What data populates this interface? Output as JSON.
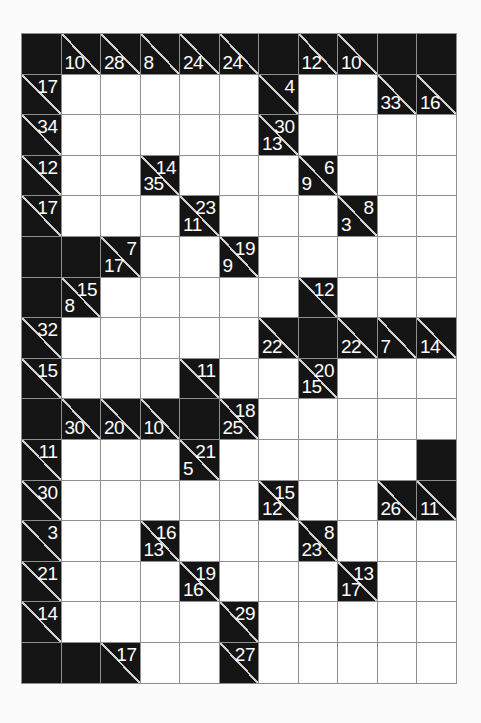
{
  "puzzle": {
    "type": "kakuro",
    "rows": 16,
    "cols": 11,
    "colors": {
      "page_bg": "#fbfbfb",
      "block": "#141414",
      "cell_bg": "#fefefe",
      "grid_line": "#8f8f8f",
      "diagonal": "#cfcfcf",
      "clue_text": "#ffffff"
    },
    "grid": [
      [
        {
          "t": "B"
        },
        {
          "t": "C",
          "d": 10
        },
        {
          "t": "C",
          "d": 28
        },
        {
          "t": "C",
          "d": 8
        },
        {
          "t": "C",
          "d": 24
        },
        {
          "t": "C",
          "d": 24
        },
        {
          "t": "B"
        },
        {
          "t": "C",
          "d": 12
        },
        {
          "t": "C",
          "d": 10
        },
        {
          "t": "B"
        },
        {
          "t": "B"
        }
      ],
      [
        {
          "t": "C",
          "a": 17
        },
        {
          "t": "W"
        },
        {
          "t": "W"
        },
        {
          "t": "W"
        },
        {
          "t": "W"
        },
        {
          "t": "W"
        },
        {
          "t": "C",
          "a": 4
        },
        {
          "t": "W"
        },
        {
          "t": "W"
        },
        {
          "t": "C",
          "d": 33
        },
        {
          "t": "C",
          "d": 16
        }
      ],
      [
        {
          "t": "C",
          "a": 34
        },
        {
          "t": "W"
        },
        {
          "t": "W"
        },
        {
          "t": "W"
        },
        {
          "t": "W"
        },
        {
          "t": "W"
        },
        {
          "t": "C",
          "a": 30,
          "d": 13
        },
        {
          "t": "W"
        },
        {
          "t": "W"
        },
        {
          "t": "W"
        },
        {
          "t": "W"
        }
      ],
      [
        {
          "t": "C",
          "a": 12
        },
        {
          "t": "W"
        },
        {
          "t": "W"
        },
        {
          "t": "C",
          "a": 14,
          "d": 35
        },
        {
          "t": "W"
        },
        {
          "t": "W"
        },
        {
          "t": "W"
        },
        {
          "t": "C",
          "a": 6,
          "d": 9
        },
        {
          "t": "W"
        },
        {
          "t": "W"
        },
        {
          "t": "W"
        }
      ],
      [
        {
          "t": "C",
          "a": 17
        },
        {
          "t": "W"
        },
        {
          "t": "W"
        },
        {
          "t": "W"
        },
        {
          "t": "C",
          "a": 23,
          "d": 11
        },
        {
          "t": "W"
        },
        {
          "t": "W"
        },
        {
          "t": "W"
        },
        {
          "t": "C",
          "a": 8,
          "d": 3
        },
        {
          "t": "W"
        },
        {
          "t": "W"
        }
      ],
      [
        {
          "t": "B"
        },
        {
          "t": "B"
        },
        {
          "t": "C",
          "a": 7,
          "d": 17
        },
        {
          "t": "W"
        },
        {
          "t": "W"
        },
        {
          "t": "C",
          "a": 19,
          "d": 9
        },
        {
          "t": "W"
        },
        {
          "t": "W"
        },
        {
          "t": "W"
        },
        {
          "t": "W"
        },
        {
          "t": "W"
        }
      ],
      [
        {
          "t": "B"
        },
        {
          "t": "C",
          "a": 15,
          "d": 8
        },
        {
          "t": "W"
        },
        {
          "t": "W"
        },
        {
          "t": "W"
        },
        {
          "t": "W"
        },
        {
          "t": "W"
        },
        {
          "t": "C",
          "a": 12
        },
        {
          "t": "W"
        },
        {
          "t": "W"
        },
        {
          "t": "W"
        }
      ],
      [
        {
          "t": "C",
          "a": 32
        },
        {
          "t": "W"
        },
        {
          "t": "W"
        },
        {
          "t": "W"
        },
        {
          "t": "W"
        },
        {
          "t": "W"
        },
        {
          "t": "C",
          "d": 22
        },
        {
          "t": "B"
        },
        {
          "t": "C",
          "d": 22
        },
        {
          "t": "C",
          "d": 7
        },
        {
          "t": "C",
          "d": 14
        }
      ],
      [
        {
          "t": "C",
          "a": 15
        },
        {
          "t": "W"
        },
        {
          "t": "W"
        },
        {
          "t": "W"
        },
        {
          "t": "C",
          "a": 11
        },
        {
          "t": "W"
        },
        {
          "t": "W"
        },
        {
          "t": "C",
          "a": 20,
          "d": 15
        },
        {
          "t": "W"
        },
        {
          "t": "W"
        },
        {
          "t": "W"
        }
      ],
      [
        {
          "t": "B"
        },
        {
          "t": "C",
          "d": 30
        },
        {
          "t": "C",
          "d": 20
        },
        {
          "t": "C",
          "d": 10
        },
        {
          "t": "B"
        },
        {
          "t": "C",
          "a": 18,
          "d": 25
        },
        {
          "t": "W"
        },
        {
          "t": "W"
        },
        {
          "t": "W"
        },
        {
          "t": "W"
        },
        {
          "t": "W"
        }
      ],
      [
        {
          "t": "C",
          "a": 11
        },
        {
          "t": "W"
        },
        {
          "t": "W"
        },
        {
          "t": "W"
        },
        {
          "t": "C",
          "a": 21,
          "d": 5
        },
        {
          "t": "W"
        },
        {
          "t": "W"
        },
        {
          "t": "W"
        },
        {
          "t": "W"
        },
        {
          "t": "W"
        },
        {
          "t": "B"
        }
      ],
      [
        {
          "t": "C",
          "a": 30
        },
        {
          "t": "W"
        },
        {
          "t": "W"
        },
        {
          "t": "W"
        },
        {
          "t": "W"
        },
        {
          "t": "W"
        },
        {
          "t": "C",
          "a": 15,
          "d": 12
        },
        {
          "t": "W"
        },
        {
          "t": "W"
        },
        {
          "t": "C",
          "d": 26
        },
        {
          "t": "C",
          "d": 11
        }
      ],
      [
        {
          "t": "C",
          "a": 3
        },
        {
          "t": "W"
        },
        {
          "t": "W"
        },
        {
          "t": "C",
          "a": 16,
          "d": 13
        },
        {
          "t": "W"
        },
        {
          "t": "W"
        },
        {
          "t": "W"
        },
        {
          "t": "C",
          "a": 8,
          "d": 23
        },
        {
          "t": "W"
        },
        {
          "t": "W"
        },
        {
          "t": "W"
        }
      ],
      [
        {
          "t": "C",
          "a": 21
        },
        {
          "t": "W"
        },
        {
          "t": "W"
        },
        {
          "t": "W"
        },
        {
          "t": "C",
          "a": 19,
          "d": 16
        },
        {
          "t": "W"
        },
        {
          "t": "W"
        },
        {
          "t": "W"
        },
        {
          "t": "C",
          "a": 13,
          "d": 17
        },
        {
          "t": "W"
        },
        {
          "t": "W"
        }
      ],
      [
        {
          "t": "C",
          "a": 14
        },
        {
          "t": "W"
        },
        {
          "t": "W"
        },
        {
          "t": "W"
        },
        {
          "t": "W"
        },
        {
          "t": "C",
          "a": 29
        },
        {
          "t": "W"
        },
        {
          "t": "W"
        },
        {
          "t": "W"
        },
        {
          "t": "W"
        },
        {
          "t": "W"
        }
      ],
      [
        {
          "t": "B"
        },
        {
          "t": "B"
        },
        {
          "t": "C",
          "a": 17
        },
        {
          "t": "W"
        },
        {
          "t": "W"
        },
        {
          "t": "C",
          "a": 27
        },
        {
          "t": "W"
        },
        {
          "t": "W"
        },
        {
          "t": "W"
        },
        {
          "t": "W"
        },
        {
          "t": "W"
        }
      ]
    ]
  }
}
